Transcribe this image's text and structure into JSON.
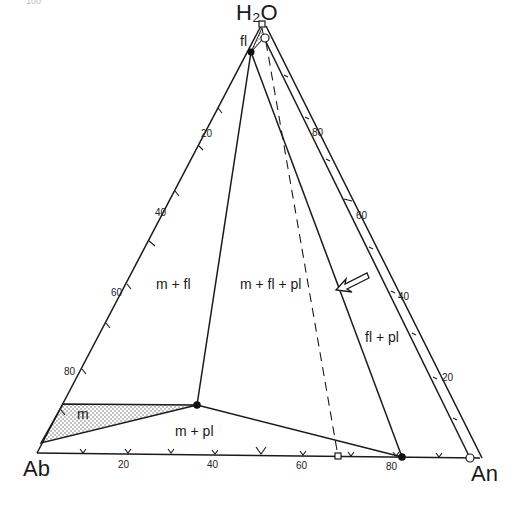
{
  "page": {
    "number": "100"
  },
  "diagram": {
    "vertices": {
      "top": "H₂O",
      "left": "Ab",
      "right": "An"
    },
    "fields": {
      "fl": "fl",
      "m": "m",
      "m_fl": "m + fl",
      "m_fl_pl": "m + fl + pl",
      "m_pl": "m + pl",
      "fl_pl": "fl + pl"
    },
    "ticks": {
      "left_edge": [
        "20",
        "40",
        "60",
        "80"
      ],
      "base": [
        "20",
        "40",
        "60",
        "80"
      ],
      "right_edge": [
        "80",
        "60",
        "40",
        "20"
      ]
    },
    "colors": {
      "line": "#1a1a1a",
      "background": "#ffffff",
      "stipple": "#555555"
    }
  }
}
